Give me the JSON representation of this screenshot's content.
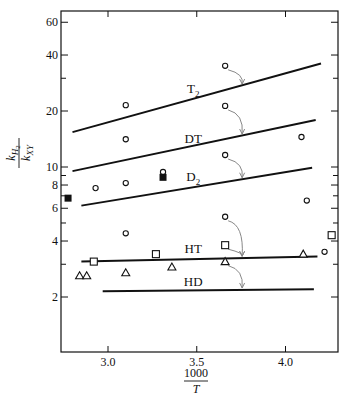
{
  "chart_data": {
    "type": "line",
    "title": "",
    "xlabel": "1000/T",
    "xlabel_numerator": "1000",
    "xlabel_denominator": "T",
    "ylabel": "k_H2 / k_XY",
    "ylabel_numerator": "k",
    "ylabel_numerator_sub": "H",
    "ylabel_numerator_subsub": "2",
    "ylabel_denominator": "k",
    "ylabel_denominator_sub": "XY",
    "yscale": "log",
    "xlim": [
      2.72,
      4.29
    ],
    "ylim": [
      1.2,
      68
    ],
    "grid": false,
    "legend": "none (inline line labels)",
    "x_ticks": [
      {
        "value": 3.0,
        "label": "3.0"
      },
      {
        "value": 3.5,
        "label": "3.5"
      },
      {
        "value": 4.0,
        "label": "4.0"
      }
    ],
    "y_ticks": [
      {
        "value": 60,
        "label": "60"
      },
      {
        "value": 40,
        "label": "40"
      },
      {
        "value": 30,
        "label": ""
      },
      {
        "value": 20,
        "label": "20"
      },
      {
        "value": 10,
        "label": "10"
      },
      {
        "value": 9,
        "label": ""
      },
      {
        "value": 8,
        "label": "8"
      },
      {
        "value": 7,
        "label": ""
      },
      {
        "value": 6,
        "label": "6"
      },
      {
        "value": 5,
        "label": ""
      },
      {
        "value": 4,
        "label": "4"
      },
      {
        "value": 3,
        "label": ""
      },
      {
        "value": 2,
        "label": "2"
      }
    ],
    "series": [
      {
        "name": "T2",
        "label": "T",
        "label_sub": "2",
        "kind": "fit-line",
        "x": [
          2.8,
          4.2
        ],
        "y": [
          15.4,
          36
        ],
        "label_at": [
          3.48,
          25
        ]
      },
      {
        "name": "DT",
        "label": "DT",
        "label_sub": "",
        "kind": "fit-line",
        "x": [
          2.8,
          4.17
        ],
        "y": [
          9.5,
          17.9
        ],
        "label_at": [
          3.48,
          13.5
        ]
      },
      {
        "name": "D2",
        "label": "D",
        "label_sub": "2",
        "kind": "fit-line",
        "x": [
          2.85,
          4.15
        ],
        "y": [
          6.2,
          9.9
        ],
        "label_at": [
          3.48,
          8.4
        ]
      },
      {
        "name": "HT",
        "label": "HT",
        "label_sub": "",
        "kind": "fit-line",
        "x": [
          2.85,
          4.18
        ],
        "y": [
          3.1,
          3.3
        ],
        "label_at": [
          3.48,
          3.45
        ]
      },
      {
        "name": "HD",
        "label": "HD",
        "label_sub": "",
        "kind": "fit-line",
        "x": [
          2.97,
          4.16
        ],
        "y": [
          2.15,
          2.2
        ],
        "label_at": [
          3.48,
          2.28
        ]
      }
    ],
    "points": {
      "open_circle": [
        {
          "x": 2.93,
          "y": 7.7
        },
        {
          "x": 3.1,
          "y": 21.5
        },
        {
          "x": 3.1,
          "y": 14.1
        },
        {
          "x": 3.1,
          "y": 8.2
        },
        {
          "x": 3.1,
          "y": 4.4
        },
        {
          "x": 3.31,
          "y": 9.4
        },
        {
          "x": 3.66,
          "y": 35
        },
        {
          "x": 3.66,
          "y": 21.3
        },
        {
          "x": 3.66,
          "y": 11.6
        },
        {
          "x": 3.66,
          "y": 5.4
        },
        {
          "x": 4.09,
          "y": 14.5
        },
        {
          "x": 4.12,
          "y": 6.6
        },
        {
          "x": 4.22,
          "y": 3.5
        }
      ],
      "filled_square": [
        {
          "x": 2.775,
          "y": 6.8
        },
        {
          "x": 3.31,
          "y": 8.8
        }
      ],
      "open_square": [
        {
          "x": 2.92,
          "y": 3.1
        },
        {
          "x": 3.27,
          "y": 3.4
        },
        {
          "x": 3.66,
          "y": 3.8
        },
        {
          "x": 4.26,
          "y": 4.3
        }
      ],
      "open_triangle": [
        {
          "x": 2.84,
          "y": 2.6
        },
        {
          "x": 2.88,
          "y": 2.6
        },
        {
          "x": 3.1,
          "y": 2.7
        },
        {
          "x": 3.36,
          "y": 2.9
        },
        {
          "x": 3.66,
          "y": 3.1
        },
        {
          "x": 4.1,
          "y": 3.4
        }
      ]
    },
    "annotations": [
      {
        "type": "curved-arrow",
        "from": [
          3.66,
          35
        ],
        "to_series": "T2"
      },
      {
        "type": "curved-arrow",
        "from": [
          3.66,
          21.3
        ],
        "to_series": "DT"
      },
      {
        "type": "curved-arrow",
        "from": [
          3.66,
          11.6
        ],
        "to_series": "D2"
      },
      {
        "type": "curved-arrow",
        "from": [
          3.66,
          5.4
        ],
        "to_series": "HT"
      },
      {
        "type": "curved-arrow",
        "from": [
          3.66,
          3.8
        ],
        "to_series": "HT"
      },
      {
        "type": "curved-arrow",
        "from": [
          3.66,
          3.1
        ],
        "to_series": "HD"
      }
    ]
  },
  "colors": {
    "ink": "#111111",
    "arrow": "#888888",
    "background": "#ffffff"
  }
}
